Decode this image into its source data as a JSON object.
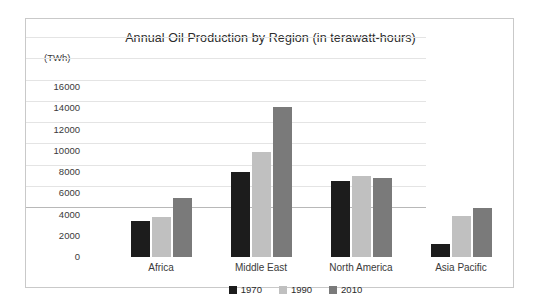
{
  "chart_data": {
    "type": "bar",
    "title": "Annual Oil Production by Region (in terawatt-hours)",
    "xlabel": "",
    "ylabel": "(TWh)",
    "ylim": [
      0,
      16000
    ],
    "ytick_step": 2000,
    "yticks": [
      "16000",
      "14000",
      "12000",
      "10000",
      "8000",
      "6000",
      "4000",
      "2000",
      "0"
    ],
    "ytick_values": [
      16000,
      14000,
      12000,
      10000,
      8000,
      6000,
      4000,
      2000,
      0
    ],
    "grid": true,
    "legend_position": "bottom",
    "categories": [
      "Africa",
      "Middle East",
      "North America",
      "Asia Pacific"
    ],
    "series": [
      {
        "name": "1970",
        "color": "#1c1c1c",
        "values": [
          3400,
          8000,
          7200,
          1200
        ]
      },
      {
        "name": "1990",
        "color": "#c0c0c0",
        "values": [
          3750,
          9900,
          7650,
          3850
        ]
      },
      {
        "name": "2010",
        "color": "#7a7a7a",
        "values": [
          5550,
          14150,
          7450,
          4650
        ]
      }
    ]
  },
  "axis": {
    "unit_caption": "(TWh)"
  },
  "legend": {
    "items": [
      {
        "label": "1970",
        "color": "#1c1c1c"
      },
      {
        "label": "1990",
        "color": "#c0c0c0"
      },
      {
        "label": "2010",
        "color": "#7a7a7a"
      }
    ]
  },
  "colors": {
    "frame_border": "#c9c9c9",
    "gridline": "#e4e4e4",
    "baseline": "#b8b8b8",
    "text": "#3a3a3a",
    "title_text": "#2b2b2b",
    "background": "#ffffff"
  }
}
